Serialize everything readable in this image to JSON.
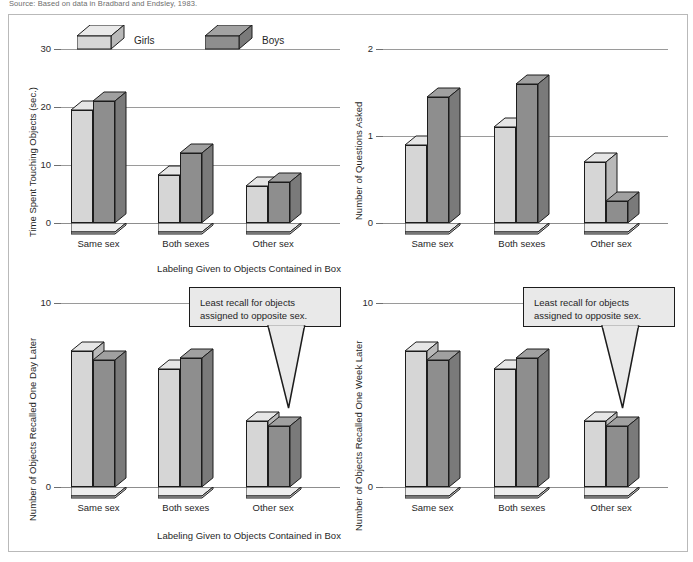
{
  "source_note": "Source: Based on data in Bradbard and Endsley, 1983.",
  "legend": {
    "girls": "Girls",
    "boys": "Boys"
  },
  "shared": {
    "xlabel": "Labeling Given to Objects Contained in Box",
    "categories": [
      "Same sex",
      "Both sexes",
      "Other sex"
    ],
    "callout": {
      "line1": "Least recall for objects",
      "line2": "assigned to opposite sex."
    },
    "colors": {
      "girls": "#d6d6d6",
      "boys": "#8e8e8e",
      "girls_side": "#b9b9b9",
      "boys_side": "#7a7a7a",
      "outline": "#1c1c1c",
      "gridline": "#9a9a9a"
    }
  },
  "chart_data": [
    {
      "id": "time-touching",
      "type": "bar",
      "title": "",
      "xlabel": "Labeling Given to Objects Contained in Box",
      "ylabel": "Time Spent Touching Objects (sec.)",
      "categories": [
        "Same sex",
        "Both sexes",
        "Other sex"
      ],
      "series": [
        {
          "name": "Girls",
          "values": [
            19.5,
            8.3,
            6.4
          ]
        },
        {
          "name": "Boys",
          "values": [
            21.0,
            12.0,
            7.0
          ]
        }
      ],
      "ylim": [
        0,
        30
      ],
      "yticks": [
        0,
        10,
        20,
        30
      ],
      "ytick_labels": [
        "0",
        "10",
        "20",
        "30"
      ],
      "grid": true,
      "legend_position": "top-left"
    },
    {
      "id": "questions-asked",
      "type": "bar",
      "title": "",
      "xlabel": "Labeling Given to Objects Contained in Box",
      "ylabel": "Number of Questions Asked",
      "categories": [
        "Same sex",
        "Both sexes",
        "Other sex"
      ],
      "series": [
        {
          "name": "Girls",
          "values": [
            0.9,
            1.1,
            0.7
          ]
        },
        {
          "name": "Boys",
          "values": [
            1.45,
            1.6,
            0.25
          ]
        }
      ],
      "ylim": [
        0,
        2
      ],
      "yticks": [
        0,
        1,
        2
      ],
      "ytick_labels": [
        "0",
        "1",
        "2"
      ],
      "grid": true,
      "legend_position": "none"
    },
    {
      "id": "recall-one-day",
      "type": "bar",
      "title": "",
      "xlabel": "Labeling Given to Objects Contained in Box",
      "ylabel": "Number of Objects Recalled One Day Later",
      "categories": [
        "Same sex",
        "Both sexes",
        "Other sex"
      ],
      "series": [
        {
          "name": "Girls",
          "values": [
            7.4,
            6.4,
            3.6
          ]
        },
        {
          "name": "Boys",
          "values": [
            6.9,
            7.0,
            3.3
          ]
        }
      ],
      "ylim": [
        0,
        10
      ],
      "yticks": [
        0,
        10
      ],
      "ytick_labels": [
        "0",
        "10"
      ],
      "grid": true,
      "legend_position": "none",
      "annotation": "Least recall for objects assigned to opposite sex."
    },
    {
      "id": "recall-one-week",
      "type": "bar",
      "title": "",
      "xlabel": "Labeling Given to Objects Contained in Box",
      "ylabel": "Number of Objects Recalled One Week Later",
      "categories": [
        "Same sex",
        "Both sexes",
        "Other sex"
      ],
      "series": [
        {
          "name": "Girls",
          "values": [
            7.4,
            6.4,
            3.6
          ]
        },
        {
          "name": "Boys",
          "values": [
            6.9,
            7.0,
            3.3
          ]
        }
      ],
      "ylim": [
        0,
        10
      ],
      "yticks": [
        0,
        10
      ],
      "ytick_labels": [
        "0",
        "10"
      ],
      "grid": true,
      "legend_position": "none",
      "annotation": "Least recall for objects assigned to opposite sex."
    }
  ]
}
